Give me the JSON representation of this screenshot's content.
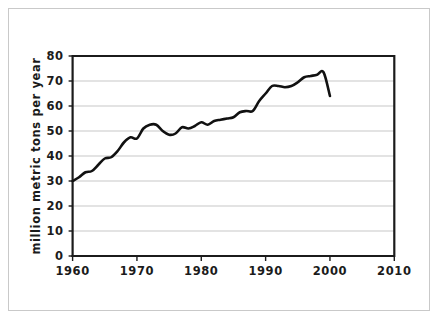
{
  "figure": {
    "background_color": "#ffffff",
    "frame_color": "#c9c9c9",
    "axis_color": "#1b1b1b",
    "grid_color": "#c8c8c8",
    "series_color": "#111111"
  },
  "chart_data": {
    "type": "line",
    "title": "",
    "subtitle": "",
    "xlabel": "",
    "ylabel": "million metric tons per year",
    "xlim": [
      1960,
      2010
    ],
    "ylim": [
      0,
      80
    ],
    "grid": "horizontal",
    "legend": "none",
    "x_ticks": [
      1960,
      1970,
      1980,
      1990,
      2000,
      2010
    ],
    "x_tick_labels": [
      "1960",
      "1970",
      "1980",
      "1990",
      "2000",
      "2010"
    ],
    "y_ticks": [
      0,
      10,
      20,
      30,
      40,
      50,
      60,
      70,
      80
    ],
    "y_tick_labels": [
      "0",
      "10",
      "20",
      "30",
      "40",
      "50",
      "60",
      "70",
      "80"
    ],
    "series": [
      {
        "name": "production",
        "x": [
          1960,
          1961,
          1962,
          1963,
          1964,
          1965,
          1966,
          1967,
          1968,
          1969,
          1970,
          1971,
          1972,
          1973,
          1974,
          1975,
          1976,
          1977,
          1978,
          1979,
          1980,
          1981,
          1982,
          1983,
          1984,
          1985,
          1986,
          1987,
          1988,
          1989,
          1990,
          1991,
          1992,
          1993,
          1994,
          1995,
          1996,
          1997,
          1998
        ],
        "values": [
          30.0,
          31.5,
          33.5,
          34.0,
          36.5,
          39.0,
          39.5,
          42.0,
          45.5,
          47.5,
          47.0,
          51.0,
          52.5,
          52.5,
          50.0,
          48.5,
          49.0,
          51.5,
          51.0,
          52.0,
          53.5,
          52.5,
          54.0,
          54.5,
          55.0,
          55.5,
          57.5,
          58.0,
          58.0,
          62.0,
          65.0,
          68.0,
          69.5,
          69.5,
          71.5,
          72.5,
          72.0,
          70.0,
          68.5
        ]
      }
    ],
    "series_extended": {
      "note": "curve continues after 1998 sample in source; plotted path ends 1998",
      "tail_x": [
        1991,
        1992,
        1993,
        1994,
        1995,
        1996,
        1997,
        1998,
        1999,
        2000
      ],
      "tail_values": [
        68.0,
        68.0,
        67.5,
        68.0,
        69.5,
        71.5,
        72.0,
        72.5,
        73.5,
        64.0
      ]
    }
  }
}
